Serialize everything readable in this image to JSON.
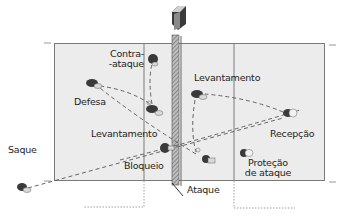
{
  "diagram": {
    "type": "volleyball-court-play-sequence",
    "colors": {
      "court_fill": "#ececec",
      "court_line": "#7a7a7a",
      "text": "#1e1e1e",
      "path": "#555555",
      "player_dark": "#3a3a3a",
      "player_light": "#dcdcdc"
    },
    "labels": {
      "contra_ataque_1": "Contra-",
      "contra_ataque_2": "-ataque",
      "defesa": "Defesa",
      "levantamento_left": "Levantamento",
      "levantamento_right": "Levantamento",
      "saque": "Saque",
      "bloqueio": "Bloqueio",
      "ataque": "Ataque",
      "recepcao": "Recepção",
      "protecao_1": "Proteção",
      "protecao_2": "de ataque"
    },
    "players": [
      {
        "id": "saque",
        "icon": "player-icon",
        "x": 22,
        "y": 187
      },
      {
        "id": "defesa",
        "icon": "player-icon",
        "x": 92,
        "y": 83
      },
      {
        "id": "contra-ataque",
        "icon": "player-icon",
        "x": 153,
        "y": 59
      },
      {
        "id": "levantamento-left",
        "icon": "player-icon",
        "x": 152,
        "y": 109
      },
      {
        "id": "bloqueio",
        "icon": "player-icon",
        "x": 165,
        "y": 148
      },
      {
        "id": "levantamento-right",
        "icon": "player-icon",
        "x": 197,
        "y": 94
      },
      {
        "id": "ataque",
        "icon": "player-icon",
        "x": 206,
        "y": 159
      },
      {
        "id": "recepcao",
        "icon": "player-icon",
        "x": 288,
        "y": 113
      },
      {
        "id": "protecao",
        "icon": "player-icon",
        "x": 244,
        "y": 153
      }
    ]
  }
}
